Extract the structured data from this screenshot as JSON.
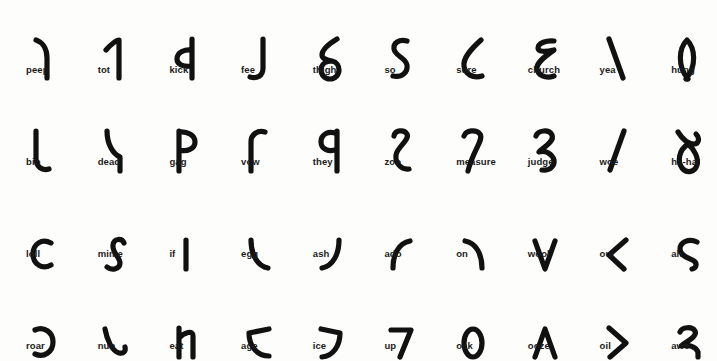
{
  "page": {
    "background_color": "#fdfdfc",
    "ink_color": "#111111",
    "columns": 10,
    "rows": 4
  },
  "rows": [
    {
      "name": "tall-consonants",
      "cells": [
        {
          "label": "peep",
          "glyph": "peep-glyph"
        },
        {
          "label": "tot",
          "glyph": "tot-glyph"
        },
        {
          "label": "kick",
          "glyph": "kick-glyph"
        },
        {
          "label": "fee",
          "glyph": "fee-glyph"
        },
        {
          "label": "thigh",
          "glyph": "thigh-glyph"
        },
        {
          "label": "so",
          "glyph": "so-glyph"
        },
        {
          "label": "sure",
          "glyph": "sure-glyph"
        },
        {
          "label": "church",
          "glyph": "church-glyph"
        },
        {
          "label": "yea",
          "glyph": "yea-glyph"
        },
        {
          "label": "hung",
          "glyph": "hung-glyph"
        }
      ]
    },
    {
      "name": "deep-consonants",
      "cells": [
        {
          "label": "bib",
          "glyph": "bib-glyph"
        },
        {
          "label": "dead",
          "glyph": "dead-glyph"
        },
        {
          "label": "gag",
          "glyph": "gag-glyph"
        },
        {
          "label": "vow",
          "glyph": "vow-glyph"
        },
        {
          "label": "they",
          "glyph": "they-glyph"
        },
        {
          "label": "zoo",
          "glyph": "zoo-glyph"
        },
        {
          "label": "measure",
          "glyph": "measure-glyph"
        },
        {
          "label": "judge",
          "glyph": "judge-glyph"
        },
        {
          "label": "woe",
          "glyph": "woe-glyph"
        },
        {
          "label": "ha-ha",
          "glyph": "ha-ha-glyph"
        }
      ]
    },
    {
      "name": "short-vowels",
      "cells": [
        {
          "label": "loll",
          "glyph": "loll-glyph"
        },
        {
          "label": "mime",
          "glyph": "mime-glyph"
        },
        {
          "label": "if",
          "glyph": "if-glyph"
        },
        {
          "label": "egg",
          "glyph": "egg-glyph"
        },
        {
          "label": "ash",
          "glyph": "ash-glyph"
        },
        {
          "label": "ado",
          "glyph": "ado-glyph"
        },
        {
          "label": "on",
          "glyph": "on-glyph"
        },
        {
          "label": "wool",
          "glyph": "wool-glyph"
        },
        {
          "label": "out",
          "glyph": "out-glyph"
        },
        {
          "label": "ah",
          "glyph": "ah-glyph"
        }
      ]
    },
    {
      "name": "long-vowels",
      "cells": [
        {
          "label": "roar",
          "glyph": "roar-glyph"
        },
        {
          "label": "nun",
          "glyph": "nun-glyph"
        },
        {
          "label": "eat",
          "glyph": "eat-glyph"
        },
        {
          "label": "age",
          "glyph": "age-glyph"
        },
        {
          "label": "ice",
          "glyph": "ice-glyph"
        },
        {
          "label": "up",
          "glyph": "up-glyph"
        },
        {
          "label": "oak",
          "glyph": "oak-glyph"
        },
        {
          "label": "ooze",
          "glyph": "ooze-glyph"
        },
        {
          "label": "oil",
          "glyph": "oil-glyph"
        },
        {
          "label": "awe",
          "glyph": "awe-glyph"
        }
      ]
    }
  ]
}
